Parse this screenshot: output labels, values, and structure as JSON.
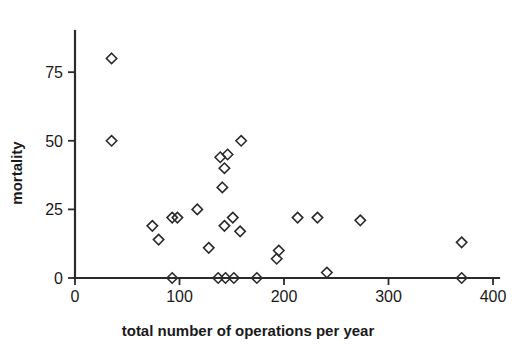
{
  "chart_data": {
    "type": "scatter",
    "title": "",
    "xlabel": "total number of operations per year",
    "ylabel": "mortality",
    "xlim": [
      0,
      400
    ],
    "ylim": [
      0,
      90
    ],
    "xticks": [
      0,
      100,
      200,
      300,
      400
    ],
    "yticks": [
      0,
      25,
      50,
      75
    ],
    "xtick_labels": [
      "0",
      "100",
      "200",
      "300",
      "400"
    ],
    "ytick_labels": [
      "0",
      "25",
      "50",
      "75"
    ],
    "grid": false,
    "legend": false,
    "marker": "diamond-open",
    "marker_color": "#2b2b2b",
    "points": [
      {
        "x": 35,
        "y": 80
      },
      {
        "x": 35,
        "y": 50
      },
      {
        "x": 159,
        "y": 50
      },
      {
        "x": 139,
        "y": 44
      },
      {
        "x": 146,
        "y": 45
      },
      {
        "x": 143,
        "y": 40
      },
      {
        "x": 141,
        "y": 33
      },
      {
        "x": 117,
        "y": 25
      },
      {
        "x": 93,
        "y": 22
      },
      {
        "x": 98,
        "y": 22
      },
      {
        "x": 151,
        "y": 22
      },
      {
        "x": 213,
        "y": 22
      },
      {
        "x": 232,
        "y": 22
      },
      {
        "x": 273,
        "y": 21
      },
      {
        "x": 74,
        "y": 19
      },
      {
        "x": 143,
        "y": 19
      },
      {
        "x": 158,
        "y": 17
      },
      {
        "x": 80,
        "y": 14
      },
      {
        "x": 370,
        "y": 13
      },
      {
        "x": 128,
        "y": 11
      },
      {
        "x": 195,
        "y": 10
      },
      {
        "x": 193,
        "y": 7
      },
      {
        "x": 241,
        "y": 2
      },
      {
        "x": 93,
        "y": 0
      },
      {
        "x": 137,
        "y": 0
      },
      {
        "x": 144,
        "y": 0
      },
      {
        "x": 152,
        "y": 0
      },
      {
        "x": 174,
        "y": 0
      },
      {
        "x": 370,
        "y": 0
      }
    ]
  }
}
